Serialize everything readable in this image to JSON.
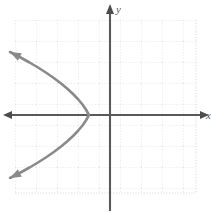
{
  "figure": {
    "title": "",
    "width": 212,
    "height": 213,
    "background_color": "#ffffff"
  },
  "labels": {
    "y_axis": "y",
    "x_axis": "x"
  },
  "colors": {
    "grid": "#d8d8d8",
    "axis": "#595959",
    "curve": "#8a8a8a",
    "background": "#ffffff"
  },
  "chart_data": {
    "type": "line",
    "title": "",
    "xlabel": "x",
    "ylabel": "y",
    "grid": true,
    "legend": "none",
    "axis_style": "arrows-both-ends",
    "grid_spacing_units": 1,
    "origin_pixel": [
      110,
      115
    ],
    "pixels_per_unit": 21,
    "xlim": [
      -4.5,
      4.1
    ],
    "ylim": [
      -3.7,
      4.5
    ],
    "annotations": [
      "leftward-opening parabola",
      "vertex on x-axis at x = -1",
      "arrowheads at both open ends"
    ],
    "series": [
      {
        "name": "parabola",
        "equation": "x = -1 - 0.45*y^2",
        "vertex": [
          -1,
          0
        ],
        "opens": "left",
        "color": "#8a8a8a",
        "points": [
          [
            -4.76,
            -3.0
          ],
          [
            -4.28,
            -2.75
          ],
          [
            -3.83,
            -2.5
          ],
          [
            -3.41,
            -2.25
          ],
          [
            -3.02,
            -2.0
          ],
          [
            -2.66,
            -1.75
          ],
          [
            -2.33,
            -1.5
          ],
          [
            -2.03,
            -1.25
          ],
          [
            -1.76,
            -1.0
          ],
          [
            -1.52,
            -0.75
          ],
          [
            -1.31,
            -0.5
          ],
          [
            -1.14,
            -0.25
          ],
          [
            -1.0,
            0.0
          ],
          [
            -1.14,
            0.25
          ],
          [
            -1.31,
            0.5
          ],
          [
            -1.52,
            0.75
          ],
          [
            -1.76,
            1.0
          ],
          [
            -2.03,
            1.25
          ],
          [
            -2.33,
            1.5
          ],
          [
            -2.66,
            1.75
          ],
          [
            -3.02,
            2.0
          ],
          [
            -3.41,
            2.25
          ],
          [
            -3.83,
            2.5
          ],
          [
            -4.28,
            2.75
          ],
          [
            -4.76,
            3.0
          ]
        ]
      }
    ]
  }
}
